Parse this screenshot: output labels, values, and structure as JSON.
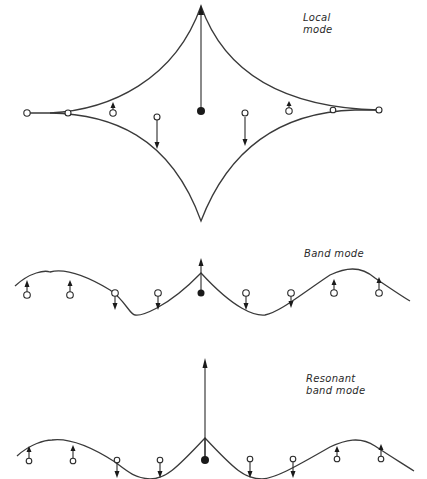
{
  "panels": [
    {
      "id": "local",
      "label_line1": "Local",
      "label_line2": "mode"
    },
    {
      "id": "band",
      "label_line1": "Band mode",
      "label_line2": ""
    },
    {
      "id": "resonant",
      "label_line1": "Resonant",
      "label_line2": "band mode"
    }
  ],
  "colors": {
    "ink": "#2a2a2a",
    "background": "#ffffff"
  }
}
